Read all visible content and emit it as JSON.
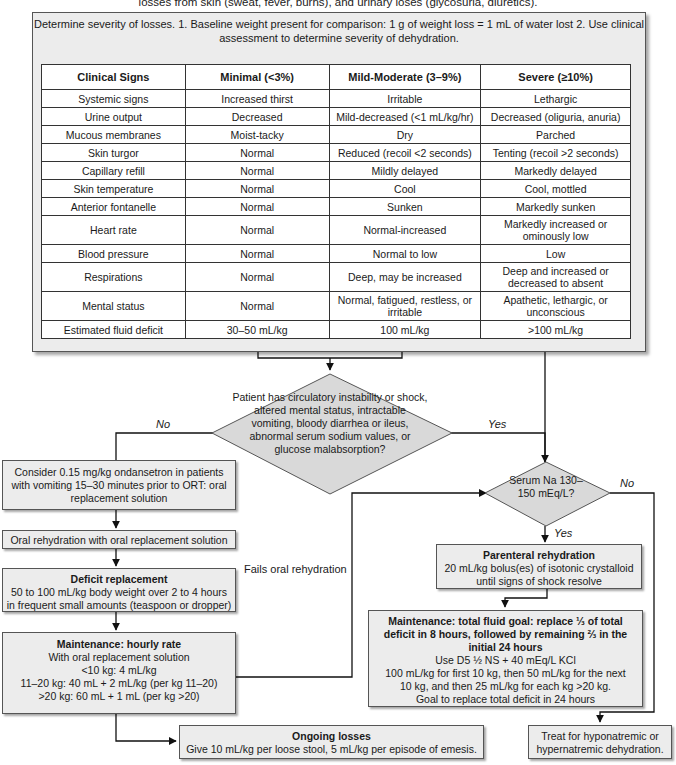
{
  "top_caption": "losses from skin (sweat, fever, burns), and urinary loses (glycosuria, diuretics).",
  "assessment": {
    "title": "Determine severity of losses.",
    "step1": "1. Baseline weight present for comparison: 1 g of weight loss = 1 mL of water lost",
    "step2": "2. Use clinical assessment to determine severity of dehydration.",
    "table": {
      "headers": [
        "Clinical Signs",
        "Minimal (<3%)",
        "Mild-Moderate (3–9%)",
        "Severe (≥10%)"
      ],
      "rows": [
        [
          "Systemic signs",
          "Increased thirst",
          "Irritable",
          "Lethargic"
        ],
        [
          "Urine output",
          "Decreased",
          "Mild-decreased (<1 mL/kg/hr)",
          "Decreased (oliguria, anuria)"
        ],
        [
          "Mucous membranes",
          "Moist-tacky",
          "Dry",
          "Parched"
        ],
        [
          "Skin turgor",
          "Normal",
          "Reduced (recoil <2 seconds)",
          "Tenting (recoil >2 seconds)"
        ],
        [
          "Capillary refill",
          "Normal",
          "Mildly delayed",
          "Markedly delayed"
        ],
        [
          "Skin temperature",
          "Normal",
          "Cool",
          "Cool, mottled"
        ],
        [
          "Anterior fontanelle",
          "Normal",
          "Sunken",
          "Markedly sunken"
        ],
        [
          "Heart rate",
          "Normal",
          "Normal-increased",
          "Markedly increased or ominously low"
        ],
        [
          "Blood pressure",
          "Normal",
          "Normal to low",
          "Low"
        ],
        [
          "Respirations",
          "Normal",
          "Deep, may be increased",
          "Deep and increased or decreased to absent"
        ],
        [
          "Mental status",
          "Normal",
          "Normal, fatigued, restless, or irritable",
          "Apathetic, lethargic, or unconscious"
        ],
        [
          "Estimated fluid deficit",
          "30–50 mL/kg",
          "100 mL/kg",
          ">100 mL/kg"
        ]
      ]
    }
  },
  "decision_main": {
    "lines": [
      "Patient has",
      "circulatory instability",
      "or shock, altered mental status,",
      "intractable vomiting, bloody diarrhea",
      "or ileus, abnormal serum sodium",
      "values, or glucose",
      "malabsorption?"
    ],
    "no_label": "No",
    "yes_label": "Yes"
  },
  "ondansetron": {
    "lines": [
      "Consider 0.15 mg/kg ondansetron in patients",
      "with vomiting 15–30 minutes prior to ORT: oral",
      "replacement solution"
    ]
  },
  "oral_rehydration": {
    "text": "Oral rehydration with oral replacement solution"
  },
  "deficit_replacement": {
    "title": "Deficit replacement",
    "lines": [
      "50 to 100 mL/kg body weight over 2 to 4 hours",
      "in frequent small amounts (teaspoon or dropper)"
    ]
  },
  "maintenance_hourly": {
    "title": "Maintenance: hourly rate",
    "lines": [
      "With oral replacement solution",
      "<10 kg: 4 mL/kg",
      "11–20 kg: 40 mL + 2 mL/kg (per kg 11–20)",
      ">20 kg: 60 mL + 1 mL (per kg >20)"
    ]
  },
  "fails_oral_label": "Fails oral rehydration",
  "decision_sodium": {
    "lines": [
      "Serum Na",
      "130–150",
      "mEq/L?"
    ],
    "no_label": "No",
    "yes_label": "Yes"
  },
  "parenteral": {
    "title": "Parenteral rehydration",
    "lines": [
      "20 mL/kg bolus(es) of isotonic crystalloid",
      "until signs of shock resolve"
    ]
  },
  "maintenance_total": {
    "title_lines": [
      "Maintenance: total fluid goal: replace ⅓ of total",
      "deficit in 8 hours, followed by remaining ⅔ in the",
      "initial 24 hours"
    ],
    "lines": [
      "Use D5 ½ NS + 40 mEq/L KCl",
      "100 mL/kg for first 10 kg, then 50 mL/kg for the next",
      "10 kg, and then 25 mL/kg for each kg >20 kg.",
      "Goal to replace total deficit in 24 hours"
    ]
  },
  "ongoing_losses": {
    "title": "Ongoing losses",
    "text": "Give 10 mL/kg per loose stool, 5 mL/kg per episode of emesis."
  },
  "treat_sodium": {
    "lines": [
      "Treat for hyponatremic or",
      "hypernatremic dehydration."
    ]
  },
  "colors": {
    "box_fill": "#ececec",
    "diamond_fill": "#d9d9d9",
    "line": "#111111",
    "table_fill": "#ffffff"
  }
}
